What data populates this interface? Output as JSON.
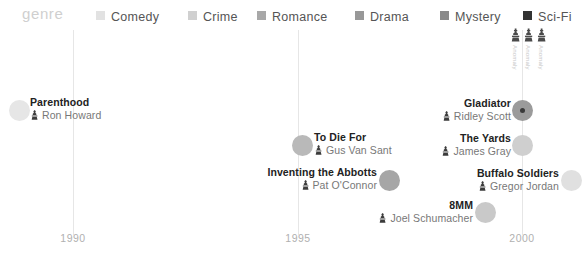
{
  "legend": {
    "title": "genre",
    "items": [
      {
        "label": "Comedy",
        "color": "#e2e2e2",
        "x": 96
      },
      {
        "label": "Crime",
        "color": "#d0d0d0",
        "x": 188
      },
      {
        "label": "Romance",
        "color": "#a8a8a8",
        "x": 257
      },
      {
        "label": "Drama",
        "color": "#989898",
        "x": 355
      },
      {
        "label": "Mystery",
        "color": "#8a8a8a",
        "x": 440
      },
      {
        "label": "Sci-Fi",
        "color": "#333333",
        "x": 523
      }
    ]
  },
  "axis": {
    "ticks": [
      {
        "label": "1990",
        "x": 73
      },
      {
        "label": "1995",
        "x": 298
      },
      {
        "label": "2000",
        "x": 522
      }
    ]
  },
  "chart_data": {
    "type": "scatter",
    "title": "genre",
    "xlabel": "",
    "ylabel": "",
    "xlim": [
      1988.4,
      2002.2
    ],
    "xticks": [
      1990,
      1995,
      2000
    ],
    "grid": true,
    "legend_position": "top",
    "series": [
      {
        "name": "Comedy",
        "color": "#e2e2e2"
      },
      {
        "name": "Crime",
        "color": "#d0d0d0"
      },
      {
        "name": "Romance",
        "color": "#a8a8a8"
      },
      {
        "name": "Drama",
        "color": "#989898"
      },
      {
        "name": "Mystery",
        "color": "#8a8a8a"
      },
      {
        "name": "Sci-Fi",
        "color": "#333333"
      }
    ],
    "points": [
      {
        "title": "Parenthood",
        "director": "Ron Howard",
        "genre": "Comedy",
        "year": 1989,
        "marker_color": "#e6e6e6",
        "marker_size": 21,
        "cx": 19,
        "cy": 110,
        "label_side": "right",
        "label_x": 30,
        "label_y": 96,
        "core": false
      },
      {
        "title": "To Die For",
        "director": "Gus Van Sant",
        "genre": "Crime",
        "year": 1995,
        "marker_color": "#b9b9b9",
        "marker_size": 21,
        "cx": 302,
        "cy": 145,
        "label_side": "right",
        "label_x": 314,
        "label_y": 131,
        "core": false
      },
      {
        "title": "Inventing the Abbotts",
        "director": "Pat O'Connor",
        "genre": "Romance",
        "year": 1997,
        "marker_color": "#a6a6a6",
        "marker_size": 21,
        "cx": 389,
        "cy": 180,
        "label_side": "left",
        "label_x": 377,
        "label_y": 166,
        "core": false
      },
      {
        "title": "Gladiator",
        "director": "Ridley Scott",
        "genre": "Sci-Fi",
        "year": 2000,
        "marker_color": "#9b9b9b",
        "marker_size": 21,
        "cx": 522,
        "cy": 110,
        "label_side": "left",
        "label_x": 511,
        "label_y": 97,
        "core": true
      },
      {
        "title": "The Yards",
        "director": "James Gray",
        "genre": "Crime",
        "year": 2000,
        "marker_color": "#cfcfcf",
        "marker_size": 21,
        "cx": 522,
        "cy": 145,
        "label_side": "left",
        "label_x": 511,
        "label_y": 132,
        "core": false
      },
      {
        "title": "Buffalo Soldiers",
        "director": "Gregor Jordan",
        "genre": "Drama",
        "year": 2001,
        "marker_color": "#e0e0e0",
        "marker_size": 21,
        "cx": 571,
        "cy": 180,
        "label_side": "left",
        "label_x": 559,
        "label_y": 167,
        "core": false
      },
      {
        "title": "8MM",
        "director": "Joel Schumacher",
        "genre": "Mystery",
        "year": 1999,
        "marker_color": "#c9c9c9",
        "marker_size": 21,
        "cx": 485,
        "cy": 212,
        "label_side": "left",
        "label_x": 473,
        "label_y": 199,
        "core": false
      }
    ],
    "cluster": {
      "x": 510,
      "y": 28,
      "pieces": [
        {
          "label": "Anomaly",
          "x": 0
        },
        {
          "label": "Anomaly",
          "x": 13
        },
        {
          "label": "Anomaly",
          "x": 26
        }
      ]
    }
  }
}
